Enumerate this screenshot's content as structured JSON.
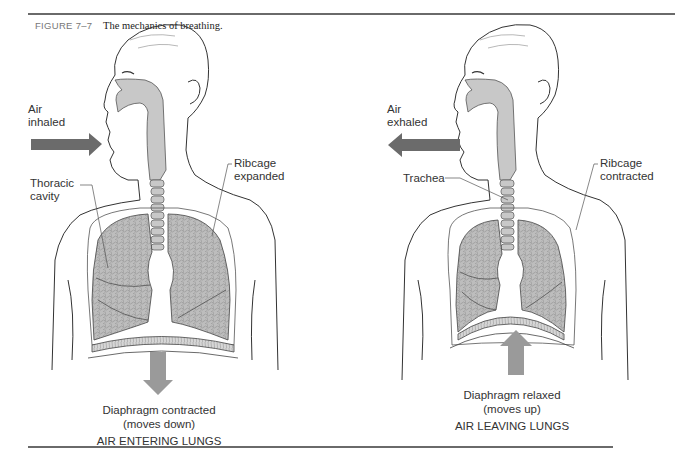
{
  "figure": {
    "number": "FIGURE 7–7",
    "title": "The mechanics of breathing."
  },
  "panels": [
    {
      "id": "inhalation",
      "labels": {
        "air": [
          "Air",
          "inhaled"
        ],
        "thoracic": [
          "Thoracic",
          "cavity"
        ],
        "ribcage": [
          "Ribcage",
          "expanded"
        ]
      },
      "caption": {
        "diaphragm": "Diaphragm contracted",
        "movement": "(moves down)",
        "state": "AIR ENTERING LUNGS"
      },
      "arrows": {
        "air": "right",
        "diaphragm": "down"
      }
    },
    {
      "id": "exhalation",
      "labels": {
        "air": [
          "Air",
          "exhaled"
        ],
        "trachea": "Trachea",
        "ribcage": [
          "Ribcage",
          "contracted"
        ]
      },
      "caption": {
        "diaphragm": "Diaphragm relaxed",
        "movement": "(moves up)",
        "state": "AIR LEAVING LUNGS"
      },
      "arrows": {
        "air": "left",
        "diaphragm": "up"
      }
    }
  ],
  "colors": {
    "air_arrow": "#6b6b6b",
    "diaphragm_arrow": "#9a9a9a",
    "airway_fill": "#c8c8c8",
    "lung_fill": "#bdbdbd",
    "outline": "#333333",
    "rule": "#6a6a6a"
  }
}
